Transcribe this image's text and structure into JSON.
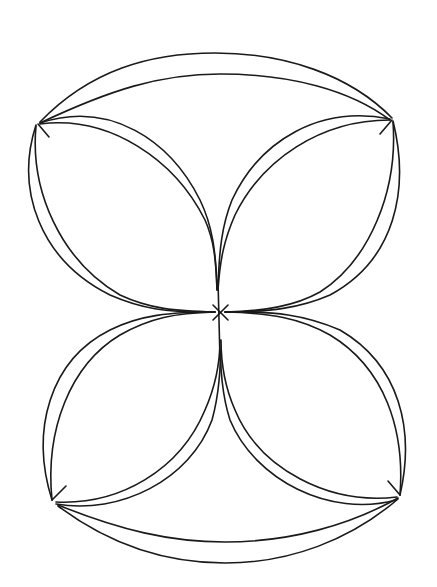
{
  "diagram": {
    "type": "graph-drawing",
    "stroke_color": "#1a1a1a",
    "background": "#ffffff",
    "nodes": [
      {
        "id": "top-left",
        "x": 38,
        "y": 124
      },
      {
        "id": "top-right",
        "x": 392,
        "y": 120
      },
      {
        "id": "center",
        "x": 220,
        "y": 312
      },
      {
        "id": "bottom-left",
        "x": 52,
        "y": 500
      },
      {
        "id": "bottom-right",
        "x": 400,
        "y": 495
      }
    ],
    "edges": [
      {
        "from": "top-left",
        "to": "top-right",
        "count": 2
      },
      {
        "from": "top-left",
        "to": "center",
        "count": 4
      },
      {
        "from": "top-right",
        "to": "center",
        "count": 4
      },
      {
        "from": "bottom-left",
        "to": "center",
        "count": 4
      },
      {
        "from": "bottom-right",
        "to": "center",
        "count": 4
      },
      {
        "from": "bottom-left",
        "to": "bottom-right",
        "count": 2
      }
    ]
  }
}
